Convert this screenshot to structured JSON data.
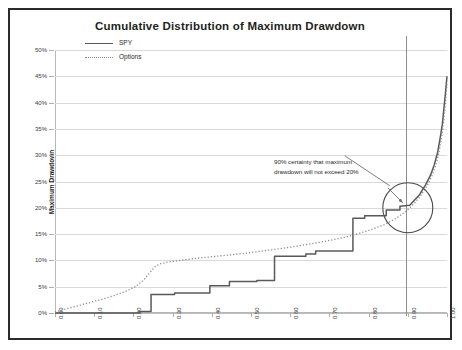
{
  "chart_data": {
    "type": "line",
    "title": "Cumulative Distribution of Maximum Drawdown",
    "xlabel": "Cumulative Percentile",
    "ylabel": "Maximum Drawdown",
    "xlim": [
      0.0,
      1.0
    ],
    "ylim": [
      0.0,
      0.5
    ],
    "grid": true,
    "legend_position": "top-left",
    "xticks": [
      "0.00",
      "0.10",
      "0.20",
      "0.30",
      "0.40",
      "0.50",
      "0.60",
      "0.70",
      "0.80",
      "0.90",
      "1.00"
    ],
    "xtick_values": [
      0.0,
      0.1,
      0.2,
      0.3,
      0.4,
      0.5,
      0.6,
      0.7,
      0.8,
      0.9,
      1.0
    ],
    "yticks": [
      "0%",
      "5%",
      "10%",
      "15%",
      "20%",
      "25%",
      "30%",
      "35%",
      "40%",
      "45%",
      "50%"
    ],
    "ytick_values": [
      0,
      0.05,
      0.1,
      0.15,
      0.2,
      0.25,
      0.3,
      0.35,
      0.4,
      0.45,
      0.5
    ],
    "series": [
      {
        "name": "SPY",
        "style": "solid-step",
        "color": "#595959",
        "x": [
          0.0,
          0.215,
          0.215,
          0.245,
          0.245,
          0.305,
          0.305,
          0.395,
          0.395,
          0.445,
          0.445,
          0.515,
          0.515,
          0.56,
          0.56,
          0.64,
          0.64,
          0.665,
          0.665,
          0.76,
          0.76,
          0.79,
          0.79,
          0.845,
          0.845,
          0.88,
          0.88,
          0.905,
          0.915,
          0.93,
          0.945,
          0.958,
          0.968,
          0.976,
          0.982,
          0.988,
          0.992,
          0.996,
          1.0
        ],
        "y": [
          0.0,
          0.0,
          0.003,
          0.003,
          0.035,
          0.035,
          0.038,
          0.038,
          0.052,
          0.052,
          0.06,
          0.06,
          0.062,
          0.062,
          0.108,
          0.108,
          0.112,
          0.112,
          0.118,
          0.118,
          0.18,
          0.18,
          0.185,
          0.185,
          0.196,
          0.196,
          0.203,
          0.205,
          0.213,
          0.225,
          0.243,
          0.262,
          0.283,
          0.305,
          0.33,
          0.358,
          0.388,
          0.418,
          0.45
        ]
      },
      {
        "name": "Options",
        "style": "dotted",
        "color": "#8a8a8a",
        "x": [
          0.0,
          0.03,
          0.06,
          0.09,
          0.12,
          0.15,
          0.18,
          0.205,
          0.225,
          0.24,
          0.255,
          0.27,
          0.29,
          0.32,
          0.36,
          0.4,
          0.44,
          0.48,
          0.52,
          0.56,
          0.6,
          0.64,
          0.68,
          0.72,
          0.76,
          0.8,
          0.84,
          0.87,
          0.895,
          0.915,
          0.932,
          0.948,
          0.96,
          0.97,
          0.978,
          0.985,
          0.99,
          0.995,
          1.0
        ],
        "y": [
          0.002,
          0.008,
          0.014,
          0.02,
          0.026,
          0.033,
          0.041,
          0.05,
          0.062,
          0.075,
          0.088,
          0.094,
          0.097,
          0.1,
          0.104,
          0.107,
          0.11,
          0.113,
          0.117,
          0.121,
          0.125,
          0.13,
          0.135,
          0.141,
          0.148,
          0.157,
          0.168,
          0.18,
          0.193,
          0.207,
          0.222,
          0.24,
          0.258,
          0.278,
          0.3,
          0.328,
          0.355,
          0.39,
          0.438
        ]
      }
    ],
    "annotations": [
      {
        "name": "certainty-note",
        "text_line1": "90% certainty that maximum",
        "text_line2": "drawdown will not exceed  20%",
        "highlight_x": 0.9,
        "highlight_y": 0.2
      }
    ],
    "reference_line": {
      "axis": "x",
      "value": 0.9
    }
  },
  "legend": {
    "items": [
      {
        "label": "SPY"
      },
      {
        "label": "Options"
      }
    ]
  }
}
